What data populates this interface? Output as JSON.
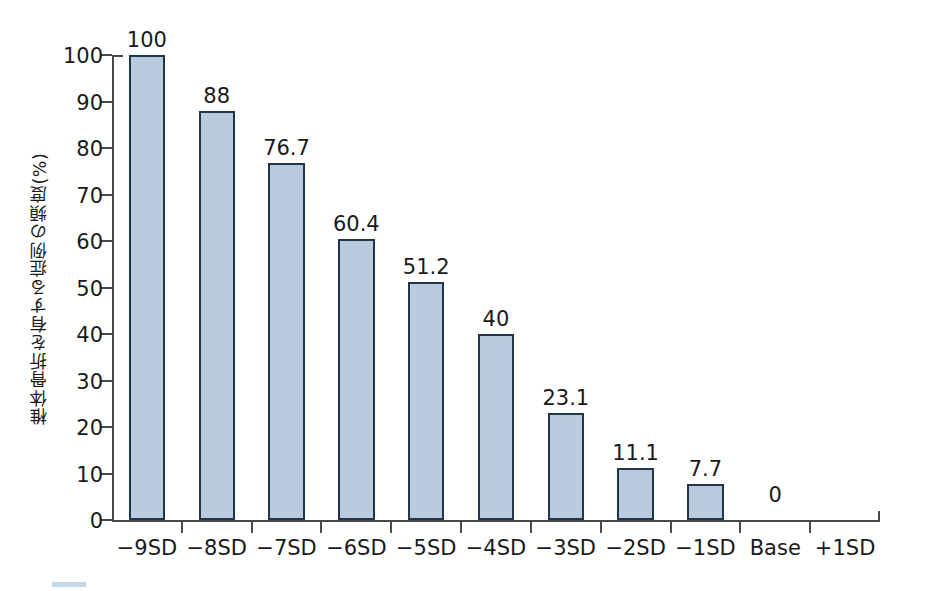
{
  "chart_data": {
    "type": "bar",
    "title": "",
    "subtitle": "",
    "xlabel": "",
    "ylabel": "椎体骨折を有する症例の頻度(%)",
    "ylim": [
      0,
      100
    ],
    "yticks": [
      0,
      10,
      20,
      30,
      40,
      50,
      60,
      70,
      80,
      90,
      100
    ],
    "ytick_labels": [
      "0",
      "10",
      "20",
      "30",
      "40",
      "50",
      "60",
      "70",
      "80",
      "90",
      "100"
    ],
    "grid": false,
    "legend": null,
    "categories": [
      "−9SD",
      "−8SD",
      "−7SD",
      "−6SD",
      "−5SD",
      "−4SD",
      "−3SD",
      "−2SD",
      "−1SD",
      "Base",
      "+1SD"
    ],
    "values": [
      100,
      88,
      76.7,
      60.4,
      51.2,
      40,
      23.1,
      11.1,
      7.7,
      0,
      null
    ],
    "value_labels": [
      "100",
      "88",
      "76.7",
      "60.4",
      "51.2",
      "40",
      "23.1",
      "11.1",
      "7.7",
      "0",
      ""
    ],
    "bars": [
      {
        "category": "−9SD",
        "value": 100,
        "label": "100",
        "has_bar": true
      },
      {
        "category": "−8SD",
        "value": 88,
        "label": "88",
        "has_bar": true
      },
      {
        "category": "−7SD",
        "value": 76.7,
        "label": "76.7",
        "has_bar": true
      },
      {
        "category": "−6SD",
        "value": 60.4,
        "label": "60.4",
        "has_bar": true
      },
      {
        "category": "−5SD",
        "value": 51.2,
        "label": "51.2",
        "has_bar": true
      },
      {
        "category": "−4SD",
        "value": 40,
        "label": "40",
        "has_bar": true
      },
      {
        "category": "−3SD",
        "value": 23.1,
        "label": "23.1",
        "has_bar": true
      },
      {
        "category": "−2SD",
        "value": 11.1,
        "label": "11.1",
        "has_bar": true
      },
      {
        "category": "−1SD",
        "value": 7.7,
        "label": "7.7",
        "has_bar": true
      },
      {
        "category": "Base",
        "value": 0,
        "label": "0",
        "has_bar": false
      },
      {
        "category": "+1SD",
        "value": null,
        "label": "",
        "has_bar": false
      }
    ],
    "colors": {
      "bar_fill": "#b9cbdc",
      "bar_border": "#22364b",
      "axis": "#4a4a4a",
      "text": "#1a1a1a",
      "background": "#ffffff"
    }
  },
  "caption": {
    "text": "",
    "accent": "#7ea8c9"
  }
}
